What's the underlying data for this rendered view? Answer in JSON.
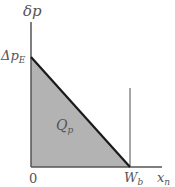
{
  "diagram": {
    "y_axis_label": "δp",
    "x_axis_label": {
      "base": "x",
      "sub": "n"
    },
    "y_intercept_label": {
      "base": "Δp",
      "sub": "E"
    },
    "x_intercept_label": {
      "base": "W",
      "sub": "b"
    },
    "origin_label": "0",
    "area_label": {
      "base": "Q",
      "sub": "p"
    },
    "colors": {
      "fill": "#b3b3b3",
      "line": "#1a1a1a",
      "axis": "#555555",
      "boundary": "#888888"
    }
  }
}
